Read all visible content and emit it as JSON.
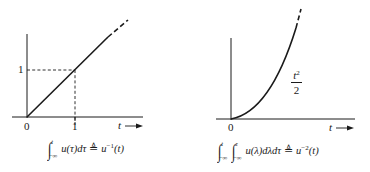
{
  "figure": {
    "colors": {
      "ink": "#1a1a1a",
      "background": "#ffffff"
    },
    "left_plot": {
      "name": "unit-ramp",
      "x_axis_label": "t",
      "x_ticks": [
        "0",
        "1"
      ],
      "y_ticks": [
        "1"
      ],
      "curve": "u^{-1}(t) = t",
      "reference_point": {
        "t": 1,
        "value": 1
      },
      "caption": {
        "integral_upper": "t",
        "integral_lower": "−∞",
        "integrand": "u(τ)dτ",
        "defined_as": "≜",
        "result_base": "u",
        "result_exp": "−1",
        "result_arg": "(t)"
      }
    },
    "right_plot": {
      "name": "unit-parabola",
      "x_axis_label": "t",
      "x_ticks": [
        "0"
      ],
      "curve_label_num": "t",
      "curve_label_exp": "2",
      "curve_label_den": "2",
      "curve": "u^{-2}(t) = t^2/2",
      "caption": {
        "outer_upper": "t",
        "outer_lower": "−∞",
        "inner_upper": "τ",
        "inner_lower": "−∞",
        "integrand": "u(λ)dλdτ",
        "defined_as": "≜",
        "result_base": "u",
        "result_exp": "−2",
        "result_arg": "(t)"
      }
    }
  }
}
